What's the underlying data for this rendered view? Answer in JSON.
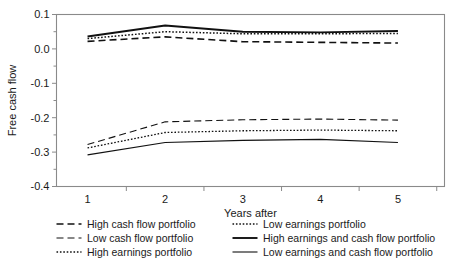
{
  "chart_data": {
    "type": "line",
    "title": "",
    "xlabel": "Years after",
    "ylabel": "Free cash flow",
    "x": [
      1,
      2,
      3,
      4,
      5
    ],
    "xlim": [
      0.6,
      5.6
    ],
    "ylim": [
      -0.4,
      0.1
    ],
    "yticks": [
      0.1,
      0.0,
      -0.1,
      -0.2,
      -0.3,
      -0.4
    ],
    "ytick_labels": [
      "0.1",
      "0.0",
      "-0.1",
      "-0.2",
      "-0.3",
      "-0.4"
    ],
    "xticks": [
      1,
      2,
      3,
      4,
      5
    ],
    "xtick_labels": [
      "1",
      "2",
      "3",
      "4",
      "5"
    ],
    "yminor_ticks": [
      0.05,
      -0.05,
      -0.15,
      -0.25,
      -0.35
    ],
    "grid": false,
    "legend_position": "below",
    "series": [
      {
        "name": "High cash flow portfolio",
        "style": "dashed",
        "dash": "7,4",
        "width": 1.6,
        "values": [
          0.022,
          0.035,
          0.021,
          0.019,
          0.017
        ]
      },
      {
        "name": "Low cash flow portfolio",
        "style": "dashed",
        "dash": "7,4",
        "width": 1.1,
        "values": [
          -0.278,
          -0.212,
          -0.206,
          -0.204,
          -0.207
        ]
      },
      {
        "name": "High earnings portfolio",
        "style": "dotted",
        "dash": "1.6,1.8",
        "width": 1.5,
        "values": [
          0.03,
          0.05,
          0.044,
          0.044,
          0.045
        ]
      },
      {
        "name": "Low earnings portfolio",
        "style": "dotted",
        "dash": "1.6,1.8",
        "width": 1.3,
        "values": [
          -0.288,
          -0.243,
          -0.238,
          -0.236,
          -0.238
        ]
      },
      {
        "name": "High earnings and cash flow portfolio",
        "style": "solid",
        "dash": "none",
        "width": 1.9,
        "values": [
          0.036,
          0.068,
          0.05,
          0.048,
          0.052
        ]
      },
      {
        "name": "Low earnings and cash flow portfolio",
        "style": "solid",
        "dash": "none",
        "width": 1.1,
        "values": [
          -0.308,
          -0.272,
          -0.266,
          -0.263,
          -0.272
        ]
      }
    ]
  },
  "legend": {
    "columns": [
      {
        "items": [
          {
            "label": "High cash flow portfolio",
            "series_index": 0
          },
          {
            "label": "Low cash flow portfolio",
            "series_index": 1
          },
          {
            "label": "High earnings portfolio",
            "series_index": 2
          }
        ]
      },
      {
        "items": [
          {
            "label": "Low earnings portfolio",
            "series_index": 3
          },
          {
            "label": "High earnings and cash flow portfolio",
            "series_index": 4
          },
          {
            "label": "Low earnings and cash flow portfolio",
            "series_index": 5
          }
        ]
      }
    ]
  },
  "colors": {
    "line": "#111111",
    "axis": "#8a8a8a",
    "text": "#1a1a1a",
    "background": "#ffffff"
  }
}
